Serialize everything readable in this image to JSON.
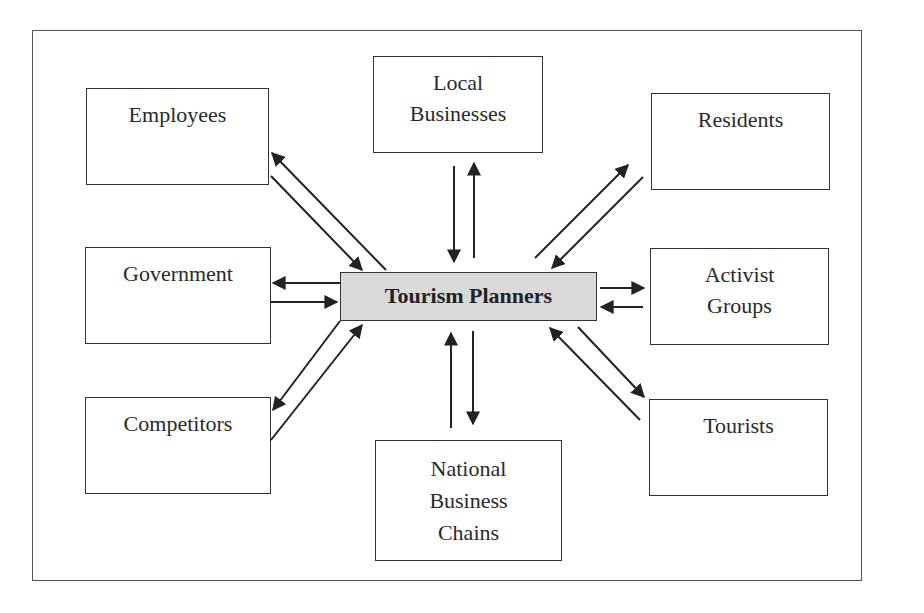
{
  "diagram": {
    "center": {
      "label": "Tourism Planners",
      "fill": "#d9d9d9"
    },
    "nodes": {
      "employees": {
        "lines": [
          "Employees"
        ]
      },
      "local_businesses": {
        "lines": [
          "Local",
          "Businesses"
        ]
      },
      "residents": {
        "lines": [
          "Residents"
        ]
      },
      "government": {
        "lines": [
          "Government"
        ]
      },
      "activist_groups": {
        "lines": [
          "Activist",
          "Groups"
        ]
      },
      "competitors": {
        "lines": [
          "Competitors"
        ]
      },
      "national_business_chains": {
        "lines": [
          "National",
          "Business",
          "Chains"
        ]
      },
      "tourists": {
        "lines": [
          "Tourists"
        ]
      }
    },
    "edges": [
      {
        "from": "Tourism Planners",
        "to": "Employees",
        "bidirectional_pair": true
      },
      {
        "from": "Tourism Planners",
        "to": "Local Businesses",
        "bidirectional_pair": true
      },
      {
        "from": "Tourism Planners",
        "to": "Residents",
        "bidirectional_pair": true
      },
      {
        "from": "Tourism Planners",
        "to": "Government",
        "bidirectional_pair": true
      },
      {
        "from": "Tourism Planners",
        "to": "Activist Groups",
        "bidirectional_pair": true
      },
      {
        "from": "Tourism Planners",
        "to": "Competitors",
        "bidirectional_pair": true
      },
      {
        "from": "Tourism Planners",
        "to": "National Business Chains",
        "bidirectional_pair": true
      },
      {
        "from": "Tourism Planners",
        "to": "Tourists",
        "bidirectional_pair": true
      }
    ]
  }
}
